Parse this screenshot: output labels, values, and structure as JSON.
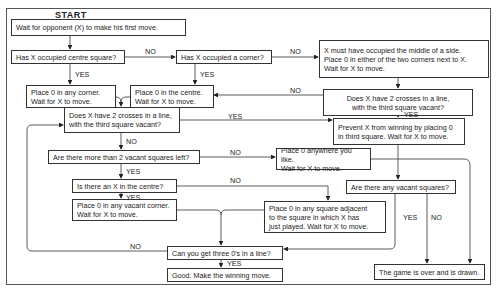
{
  "title": "START",
  "boxes": {
    "b1": "Wait for opponent (X) to make his first move.",
    "b2": "Has X occupied centre square?",
    "b3": "Has X occupied a corner?",
    "b4": "X must have occupied the middle of a side.\nPlace 0 in either of the two corners next to X.\nWait for X to move.",
    "b5": "Place 0 in any corner.\nWait for X to move.",
    "b6": "Place 0 in the centre.\nWait for X to move.",
    "b7": "Does X have 2 crosses in a line,\nwith the third square vacant?",
    "b8": "Does X have 2 crosses in a line,\nwith the third square vacant?",
    "b9": "Prevent X from winning by placing 0\nin third square. Wait for X to move.",
    "b10": "Are there more than 2 vacant squares left?",
    "b11": "Place 0 anywhere you like.\nWait for X to move.",
    "b12": "Is there an X in the centre?",
    "b13": "Are there any vacant squares?",
    "b14": "Place 0 in any vacant corner.\nWait for X to move.",
    "b15": "Place 0 in any square adjacent\nto the square in which X has\njust played. Wait for X to move.",
    "b16": "Can you get three 0's in a line?",
    "b17": "Good. Make the winning move.",
    "b18": "The game is over and is drawn."
  },
  "labels": {
    "l_b2_no": "NO",
    "l_b2_yes": "YES",
    "l_b3_no": "NO",
    "l_b3_yes": "YES",
    "l_b7_no": "NO",
    "l_b7_yes": "YES",
    "l_b8_yes": "YES",
    "l_b8_no": "NO",
    "l_b10_no": "NO",
    "l_b10_yes": "YES",
    "l_b12_no": "NO",
    "l_b12_yes": "YES",
    "l_b13_yes": "YES",
    "l_b13_no": "NO",
    "l_b16_no": "NO",
    "l_b16_yes": "YES"
  }
}
